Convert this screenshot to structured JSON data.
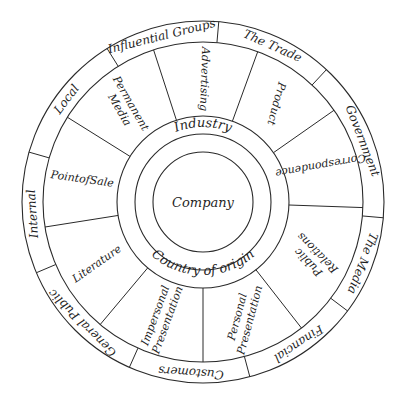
{
  "diagram": {
    "type": "concentric-wheel",
    "center": {
      "label": "Company"
    },
    "inner_ring": {
      "top_label": "Industry",
      "bottom_label": "Country of origin"
    },
    "segment_ring": {
      "segments": [
        {
          "label": "Permanent Media",
          "lines": [
            "Permanent",
            "Media"
          ],
          "mid_angle": 321
        },
        {
          "label": "Advertising",
          "lines": [
            "Advertising"
          ],
          "mid_angle": 1
        },
        {
          "label": "Product",
          "lines": [
            "Product"
          ],
          "mid_angle": 37
        },
        {
          "label": "Correspondence",
          "lines": [
            "Correspondence"
          ],
          "mid_angle": 73
        },
        {
          "label": "Public Relations",
          "lines": [
            "Public",
            "Relations"
          ],
          "mid_angle": 117
        },
        {
          "label": "Personal Presentation",
          "lines": [
            "Personal",
            "Presentation"
          ],
          "mid_angle": 161
        },
        {
          "label": "Impersonal Presentation",
          "lines": [
            "Impersonal",
            "Presentation"
          ],
          "mid_angle": 200
        },
        {
          "label": "Literature",
          "lines": [
            "Literature"
          ],
          "mid_angle": 240
        },
        {
          "label": "PointofSale",
          "lines": [
            "PointofSale"
          ],
          "mid_angle": 281
        }
      ],
      "divider_angles": [
        342,
        20,
        55,
        92,
        142,
        180,
        220,
        261,
        302
      ]
    },
    "outer_band": {
      "segments": [
        {
          "label": "Local",
          "mid_angle": 307
        },
        {
          "label": "Influential Groups",
          "mid_angle": 346
        },
        {
          "label": "The Trade",
          "mid_angle": 24
        },
        {
          "label": "Government",
          "mid_angle": 69
        },
        {
          "label": "The Media",
          "mid_angle": 111
        },
        {
          "label": "Financial",
          "mid_angle": 146
        },
        {
          "label": "Customers",
          "mid_angle": 184
        },
        {
          "label": "General Public",
          "mid_angle": 225
        },
        {
          "label": "Internal",
          "mid_angle": 266
        }
      ],
      "divider_angles": [
        328,
        5,
        43,
        95,
        127,
        165,
        204,
        247,
        286
      ]
    }
  },
  "colors": {
    "line": "#2a2a2a",
    "text": "#1f1f1f",
    "background": "#ffffff"
  }
}
